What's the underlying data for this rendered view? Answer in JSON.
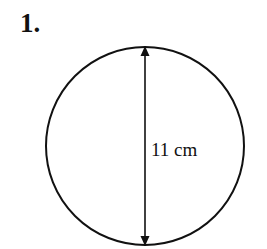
{
  "question": {
    "number": "1."
  },
  "figure": {
    "shape": "circle",
    "measurement": {
      "type": "diameter",
      "label": "11 cm",
      "value": 11,
      "unit": "cm"
    },
    "stroke_color": "#111111"
  }
}
